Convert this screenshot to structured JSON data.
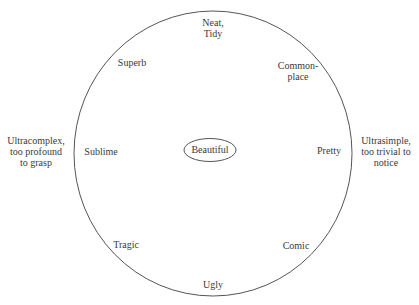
{
  "diagram": {
    "colors": {
      "stroke": "#555555",
      "text": "#3a3a3a",
      "background": "#ffffff"
    },
    "center": {
      "label": "Beautiful"
    },
    "circle_labels": {
      "top": {
        "lines": [
          "Neat,",
          "Tidy"
        ]
      },
      "top_right": {
        "lines": [
          "Common-",
          "place"
        ]
      },
      "right": {
        "lines": [
          "Pretty"
        ]
      },
      "bottom_right": {
        "lines": [
          "Comic"
        ]
      },
      "bottom": {
        "lines": [
          "Ugly"
        ]
      },
      "bottom_left": {
        "lines": [
          "Tragic"
        ]
      },
      "left": {
        "lines": [
          "Sublime"
        ]
      },
      "top_left": {
        "lines": [
          "Superb"
        ]
      }
    },
    "outside_labels": {
      "left": {
        "lines": [
          "Ultracomplex,",
          "too profound",
          "to grasp"
        ]
      },
      "right": {
        "lines": [
          "Ultrasimple,",
          "too trivial to",
          "notice"
        ]
      }
    }
  }
}
